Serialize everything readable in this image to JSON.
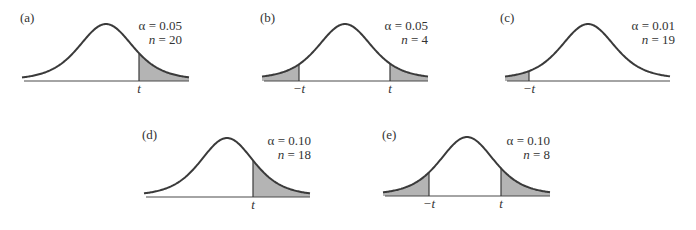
{
  "figure": {
    "panels": [
      {
        "id": "a",
        "label": "(a)",
        "alpha_text": "α = 0.05",
        "n_text": "n = 20",
        "tails": "right",
        "cut_labels": [
          "t"
        ],
        "x0": 22,
        "x1": 189,
        "peak_x": 106,
        "peak_y": 24,
        "base_y": 80,
        "axis_y": 81,
        "cuts": [
          139
        ],
        "label_x": 20,
        "label_y": 22,
        "text_x": 182,
        "text_y": 30
      },
      {
        "id": "b",
        "label": "(b)",
        "alpha_text": "α = 0.05",
        "n_text": "n = 4",
        "tails": "both",
        "cut_labels": [
          "−t",
          "t"
        ],
        "x0": 262,
        "x1": 428,
        "peak_x": 345,
        "peak_y": 24,
        "base_y": 79,
        "axis_y": 81,
        "cuts": [
          299,
          390
        ],
        "label_x": 260,
        "label_y": 22,
        "text_x": 428,
        "text_y": 30
      },
      {
        "id": "c",
        "label": "(c)",
        "alpha_text": "α = 0.01",
        "n_text": "n = 19",
        "tails": "left",
        "cut_labels": [
          "−t"
        ],
        "x0": 505,
        "x1": 670,
        "peak_x": 588,
        "peak_y": 24,
        "base_y": 79,
        "axis_y": 81,
        "cuts": [
          529
        ],
        "label_x": 500,
        "label_y": 22,
        "text_x": 675,
        "text_y": 30
      },
      {
        "id": "d",
        "label": "(d)",
        "alpha_text": "α = 0.10",
        "n_text": "n = 18",
        "tails": "right",
        "cut_labels": [
          "t"
        ],
        "x0": 144,
        "x1": 310,
        "peak_x": 227,
        "peak_y": 138,
        "base_y": 196,
        "axis_y": 197,
        "cuts": [
          253
        ],
        "label_x": 142,
        "label_y": 139,
        "text_x": 311,
        "text_y": 145
      },
      {
        "id": "e",
        "label": "(e)",
        "alpha_text": "α = 0.10",
        "n_text": "n = 8",
        "tails": "both",
        "cut_labels": [
          "−t",
          "t"
        ],
        "x0": 383,
        "x1": 550,
        "peak_x": 467,
        "peak_y": 137,
        "base_y": 195,
        "axis_y": 196,
        "cuts": [
          429,
          501
        ],
        "label_x": 382,
        "label_y": 139,
        "text_x": 550,
        "text_y": 145
      }
    ]
  },
  "colors": {
    "curve": "#3a3a3a",
    "fill": "#b4b4b4",
    "axis": "#4a4a4a",
    "text": "#333333"
  }
}
